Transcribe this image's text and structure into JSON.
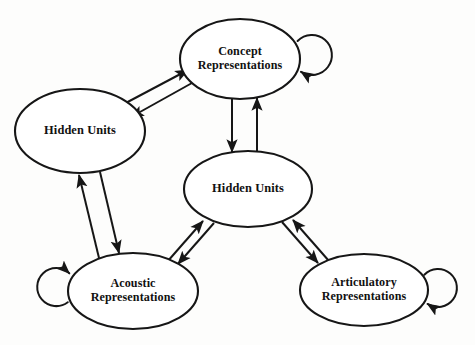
{
  "diagram": {
    "type": "node-link-diagram",
    "background_color": "#fdfdfc",
    "stroke_color": "#161616",
    "node_fill": "#ffffff",
    "nodes": [
      {
        "id": "concept",
        "name": "concept-representations",
        "label_lines": [
          "Concept",
          "Representations"
        ],
        "cx": 240,
        "cy": 59,
        "rx": 60,
        "ry": 40,
        "self_loop": true,
        "self_loop_side": "right"
      },
      {
        "id": "hidden_left",
        "name": "hidden-units-left",
        "label_lines": [
          "Hidden Units"
        ],
        "cx": 80,
        "cy": 131,
        "rx": 65,
        "ry": 42,
        "self_loop": false,
        "self_loop_side": ""
      },
      {
        "id": "hidden_center",
        "name": "hidden-units-center",
        "label_lines": [
          "Hidden Units"
        ],
        "cx": 248,
        "cy": 189,
        "rx": 64,
        "ry": 38,
        "self_loop": false,
        "self_loop_side": ""
      },
      {
        "id": "acoustic",
        "name": "acoustic-representations",
        "label_lines": [
          "Acoustic",
          "Representations"
        ],
        "cx": 133,
        "cy": 291,
        "rx": 65,
        "ry": 38,
        "self_loop": true,
        "self_loop_side": "left"
      },
      {
        "id": "articulatory",
        "name": "articulatory-representations",
        "label_lines": [
          "Articulatory",
          "Representations"
        ],
        "cx": 364,
        "cy": 290,
        "rx": 64,
        "ry": 36,
        "self_loop": true,
        "self_loop_side": "right"
      }
    ],
    "edges": [
      {
        "name": "edge-hidden-left-to-concept",
        "from": "hidden_left",
        "to": "concept",
        "direction": "up-right",
        "x1": 122,
        "y1": 105,
        "x2": 188,
        "y2": 70
      },
      {
        "name": "edge-concept-to-hidden-left",
        "from": "concept",
        "to": "hidden_left",
        "direction": "down-left",
        "x1": 192,
        "y1": 83,
        "x2": 131,
        "y2": 117
      },
      {
        "name": "edge-concept-to-hidden-center",
        "from": "concept",
        "to": "hidden_center",
        "direction": "down",
        "x1": 232,
        "y1": 97,
        "x2": 232,
        "y2": 152
      },
      {
        "name": "edge-hidden-center-to-concept",
        "from": "hidden_center",
        "to": "concept",
        "direction": "up",
        "x1": 257,
        "y1": 153,
        "x2": 257,
        "y2": 98
      },
      {
        "name": "edge-acoustic-to-hidden-left",
        "from": "acoustic",
        "to": "hidden_left",
        "direction": "up",
        "x1": 99,
        "y1": 258,
        "x2": 79,
        "y2": 175
      },
      {
        "name": "edge-hidden-left-to-acoustic",
        "from": "hidden_left",
        "to": "acoustic",
        "direction": "down",
        "x1": 100,
        "y1": 172,
        "x2": 119,
        "y2": 253
      },
      {
        "name": "edge-acoustic-to-hidden-center",
        "from": "acoustic",
        "to": "hidden_center",
        "direction": "up-right",
        "x1": 167,
        "y1": 262,
        "x2": 203,
        "y2": 221
      },
      {
        "name": "edge-hidden-center-to-acoustic",
        "from": "hidden_center",
        "to": "acoustic",
        "direction": "down-left",
        "x1": 214,
        "y1": 223,
        "x2": 178,
        "y2": 264
      },
      {
        "name": "edge-articulatory-to-hidden-center",
        "from": "articulatory",
        "to": "hidden_center",
        "direction": "up-left",
        "x1": 329,
        "y1": 261,
        "x2": 293,
        "y2": 220
      },
      {
        "name": "edge-hidden-center-to-articulatory",
        "from": "hidden_center",
        "to": "articulatory",
        "direction": "down-right",
        "x1": 282,
        "y1": 222,
        "x2": 318,
        "y2": 263
      }
    ],
    "self_loops": [
      {
        "name": "self-loop-concept",
        "node": "concept",
        "cx": 312,
        "cy": 55,
        "r": 20
      },
      {
        "name": "self-loop-acoustic",
        "node": "acoustic",
        "cx": 56,
        "cy": 287,
        "r": 19
      },
      {
        "name": "self-loop-articulatory",
        "node": "articulatory",
        "cx": 438,
        "cy": 288,
        "r": 19
      }
    ]
  }
}
